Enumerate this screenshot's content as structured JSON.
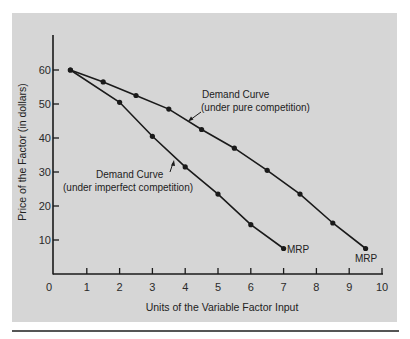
{
  "chart_data": {
    "type": "line",
    "title": "",
    "xlabel": "Units of the Variable Factor Input",
    "ylabel": "Price of the Factor (in dollars)",
    "xlim": [
      0,
      10
    ],
    "ylim": [
      0,
      70
    ],
    "x_ticks": [
      "0",
      "1",
      "2",
      "3",
      "4",
      "5",
      "6",
      "7",
      "8",
      "9",
      "10"
    ],
    "y_ticks": [
      "10",
      "20",
      "30",
      "40",
      "50",
      "60"
    ],
    "grid": false,
    "legend": "none (inline annotations)",
    "series": [
      {
        "name": "Demand Curve (under pure competition)",
        "x": [
          0.5,
          1.5,
          2.5,
          3.5,
          4.5,
          5.5,
          6.5,
          7.5,
          8.5,
          9.5
        ],
        "values": [
          60,
          56.5,
          52.5,
          48.5,
          42.5,
          37,
          30.5,
          23.5,
          15,
          7.5
        ],
        "end_label": "MRP"
      },
      {
        "name": "Demand Curve (under imperfect competition)",
        "x": [
          0.5,
          2,
          3,
          4,
          5,
          6,
          7
        ],
        "values": [
          60,
          50.5,
          40.5,
          31.5,
          23.5,
          14.5,
          7.5
        ],
        "end_label": "MRP"
      }
    ],
    "annotations": [
      {
        "line1": "Demand Curve",
        "line2": "(under pure competition)"
      },
      {
        "line1": "Demand Curve",
        "line2": "(under imperfect competition)"
      },
      {
        "text": "MRP"
      },
      {
        "text": "MRP"
      }
    ]
  },
  "labels": {
    "x_axis": "Units of the Variable Factor Input",
    "y_axis": "Price of the Factor (in dollars)",
    "pure_line1": "Demand Curve",
    "pure_line2": "(under pure competition)",
    "imperfect_line1": "Demand Curve",
    "imperfect_line2": "(under imperfect competition)",
    "mrp_imperfect": "MRP",
    "mrp_pure": "MRP"
  },
  "colors": {
    "panel": "#d6d6d6",
    "ink": "#1a1a1a"
  }
}
